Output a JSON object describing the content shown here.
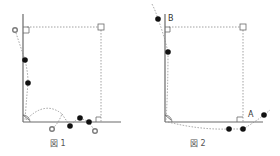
{
  "figures": [
    {
      "id": "fig1",
      "caption": "図 1",
      "labels": []
    },
    {
      "id": "fig2",
      "caption": "図 2",
      "labels": [
        {
          "text": "B"
        },
        {
          "text": "A"
        }
      ]
    }
  ],
  "colors": {
    "axis": "#6a6a6a",
    "dashed": "#8a8a8a",
    "filled_point": "#111111",
    "open_point": "#7a7a7a"
  }
}
